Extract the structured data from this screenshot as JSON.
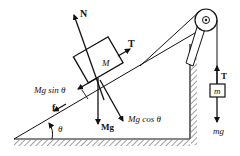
{
  "diagram": {
    "colors": {
      "ink": "#111111",
      "background": "#ffffff"
    },
    "labels": {
      "normal": "N",
      "tension_block": "T",
      "mass_block": "M",
      "mg_sin": "Mg sin θ",
      "mg_cos": "Mg cos θ",
      "weight_block": "Mg",
      "friction": "f",
      "angle": "θ",
      "tension_hanging": "T",
      "mass_hanging": "m",
      "weight_hanging": "mg"
    },
    "components": [
      "inclined-plane",
      "block-M",
      "pulley",
      "hanging-block-m",
      "ground-hatching",
      "wall-hatching"
    ]
  }
}
